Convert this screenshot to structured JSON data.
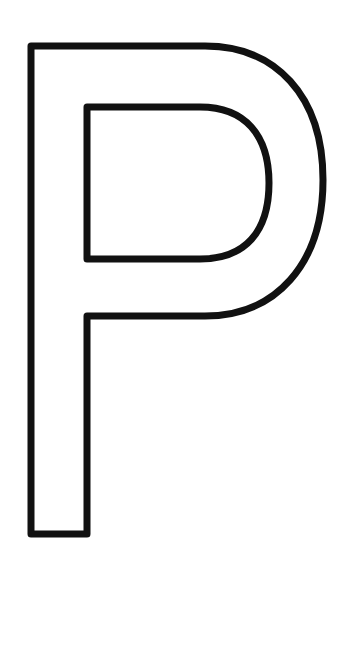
{
  "image": {
    "letter": "P",
    "style": "outlined",
    "stroke_color": "#111111",
    "fill_color": "#ffffff",
    "background_color": "#ffffff"
  }
}
